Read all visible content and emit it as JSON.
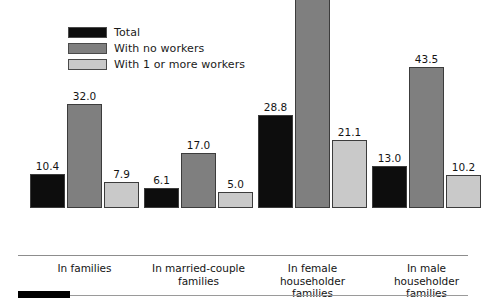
{
  "chart_data": {
    "type": "bar",
    "title": "",
    "subtitle": "",
    "xlabel": "",
    "ylabel": "",
    "ylim": [
      0,
      78
    ],
    "grid": false,
    "legend_position": "top-left",
    "value_format": "one-decimal",
    "categories": [
      "In families",
      "In married-couple\nfamilies",
      "In female\nhouseholder\nfamilies",
      "In male\nhouseholder\nfamilies"
    ],
    "series": [
      {
        "name": "Total",
        "color": "#0d0d0d",
        "values": [
          10.4,
          6.1,
          28.8,
          13.0
        ],
        "labels": [
          "10.4",
          "6.1",
          "28.8",
          "13.0"
        ]
      },
      {
        "name": "With no workers",
        "color": "#7f7f7f",
        "values": [
          32.0,
          17.0,
          70.8,
          43.5
        ],
        "labels": [
          "32.0",
          "17.0",
          "70.8",
          "43.5"
        ]
      },
      {
        "name": "With 1 or more workers",
        "color": "#c9c9c9",
        "values": [
          7.9,
          5.0,
          21.1,
          10.2
        ],
        "labels": [
          "7.9",
          "5.0",
          "21.1",
          "10.2"
        ]
      }
    ]
  },
  "legend": {
    "items": [
      {
        "label": "Total",
        "color": "#0d0d0d"
      },
      {
        "label": "With no workers",
        "color": "#7f7f7f"
      },
      {
        "label": "With 1 or more workers",
        "color": "#c9c9c9"
      }
    ]
  },
  "axis": {
    "baseline_color": "#8d8d8d"
  },
  "footer": {
    "rule_color": "#9a9a9a",
    "mark_color": "#000000"
  }
}
